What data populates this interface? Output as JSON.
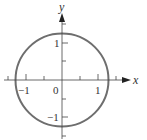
{
  "diagram": {
    "type": "circle-on-coordinate-axes",
    "axes": {
      "x_label": "x",
      "y_label": "y",
      "origin_label": "0",
      "x_tick_labels": [
        {
          "value": -1,
          "text": "−1"
        },
        {
          "value": 1,
          "text": "1"
        }
      ],
      "y_tick_labels": [
        {
          "value": 1,
          "text": "1"
        },
        {
          "value": -1,
          "text": "−1"
        }
      ],
      "tick_spacing": 0.5,
      "x_range": [
        -1.5,
        1.5
      ],
      "y_range": [
        -1.5,
        1.5
      ]
    },
    "circle": {
      "center": [
        0,
        0
      ],
      "radius_approx": 1.3,
      "stroke_color": "#6e6e6e"
    },
    "colors": {
      "axis": "#444444",
      "circle": "#6e6e6e",
      "text": "#333333"
    }
  }
}
